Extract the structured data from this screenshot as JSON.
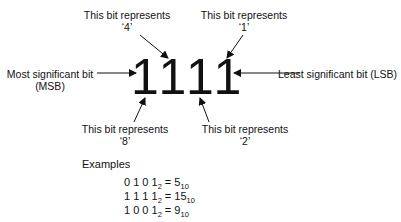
{
  "diagram": {
    "bits": [
      "1",
      "1",
      "1",
      "1"
    ],
    "labels": {
      "top_left": {
        "line1": "This bit represents",
        "line2": "‘4’"
      },
      "top_right": {
        "line1": "This bit represents",
        "line2": "‘1’"
      },
      "bottom_left": {
        "line1": "This bit represents",
        "line2": "‘8’"
      },
      "bottom_right": {
        "line1": "This bit represents",
        "line2": "‘2’"
      },
      "msb": {
        "line1": "Most significant bit",
        "line2": "(MSB)"
      },
      "lsb": {
        "line1": "Least significant bit (LSB)"
      }
    },
    "arrow_color": "#111111"
  },
  "examples": {
    "title": "Examples",
    "rows": [
      {
        "binary": "0 1 0 1",
        "base_in": "2",
        "eq": " = ",
        "decimal": "5",
        "base_out": "10"
      },
      {
        "binary": "1 1 1 1",
        "base_in": "2",
        "eq": " = ",
        "decimal": "15",
        "base_out": "10"
      },
      {
        "binary": "1 0 0 1",
        "base_in": "2",
        "eq": " = ",
        "decimal": "9",
        "base_out": "10"
      }
    ]
  }
}
